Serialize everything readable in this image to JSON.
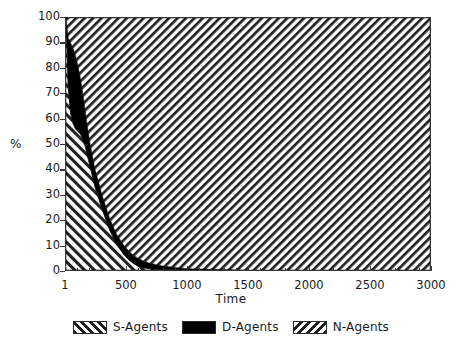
{
  "chart_data": {
    "type": "area",
    "title": "",
    "subtitle": "",
    "xlabel": "Time",
    "ylabel": "%",
    "stacked": true,
    "stack_mode": "percent",
    "grid": false,
    "legend_position": "bottom",
    "xlim": [
      1,
      3000
    ],
    "ylim": [
      0,
      100
    ],
    "xticks": [
      1,
      500,
      1000,
      1500,
      2000,
      2500,
      3000
    ],
    "xtick_labels": [
      "1",
      "500",
      "1000",
      "1500",
      "2000",
      "2500",
      "3000"
    ],
    "yticks": [
      0,
      10,
      20,
      30,
      40,
      50,
      60,
      70,
      80,
      90,
      100
    ],
    "ytick_labels": [
      "0",
      "10",
      "20",
      "30",
      "40",
      "50",
      "60",
      "70",
      "80",
      "90",
      "100"
    ],
    "x": [
      1,
      20,
      40,
      60,
      80,
      100,
      120,
      140,
      160,
      180,
      200,
      220,
      240,
      260,
      280,
      300,
      330,
      360,
      390,
      420,
      450,
      480,
      520,
      560,
      600,
      650,
      700,
      800,
      1000,
      1500,
      2000,
      2500,
      3000
    ],
    "series": [
      {
        "name": "S-Agents",
        "fill": "hatch-forward",
        "color": "#000000",
        "values": [
          100,
          72,
          62,
          58,
          56,
          55,
          54,
          52,
          49,
          45,
          41,
          37,
          33,
          30,
          27,
          24,
          20,
          16,
          13,
          10,
          8,
          6,
          4,
          2.5,
          1.5,
          0.8,
          0.4,
          0.15,
          0,
          0,
          0,
          0,
          0
        ]
      },
      {
        "name": "D-Agents",
        "fill": "solid",
        "color": "#000000",
        "values": [
          0,
          20,
          28,
          30,
          29,
          26,
          22,
          18,
          14,
          11,
          9,
          8,
          7,
          6.5,
          6,
          5.5,
          5,
          4.6,
          4.2,
          4,
          3.8,
          3.6,
          3.4,
          3.2,
          3,
          2.6,
          2.2,
          1.4,
          0.5,
          0,
          0,
          0,
          0
        ]
      },
      {
        "name": "N-Agents",
        "fill": "hatch-backward",
        "color": "#000000",
        "values": [
          0,
          8,
          10,
          12,
          15,
          19,
          24,
          30,
          37,
          44,
          50,
          55,
          60,
          63.5,
          67,
          70.5,
          75,
          79.4,
          82.8,
          86,
          88.2,
          90.4,
          92.6,
          94.3,
          95.5,
          96.6,
          97.4,
          98.45,
          99.5,
          100,
          100,
          100,
          100
        ]
      }
    ]
  },
  "legend": {
    "items": [
      {
        "label": "S-Agents",
        "pattern": "hatch-forward"
      },
      {
        "label": "D-Agents",
        "pattern": "solid"
      },
      {
        "label": "N-Agents",
        "pattern": "hatch-backward"
      }
    ]
  },
  "axes": {
    "x_title": "Time",
    "y_title": "%"
  }
}
